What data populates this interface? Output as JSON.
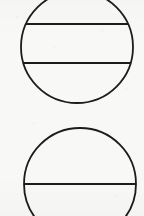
{
  "document": {
    "kind": "scanned-line-drawing",
    "title": "Two circles with horizontal chords",
    "background_color": "#f8f8f7",
    "ink_color": "#1d1c1b",
    "stroke_width": 1.8,
    "width": 144,
    "height": 216
  },
  "figures": [
    {
      "id": "top-circle",
      "label": "Upper circle with two chords",
      "shape": "circle",
      "center_x": 77,
      "center_y": 47,
      "radius": 56,
      "clipped_edge": "top",
      "chords": [
        {
          "id": "top-circle-chord-upper",
          "label": "Upper chord",
          "y": 24
        },
        {
          "id": "top-circle-chord-lower",
          "label": "Lower chord",
          "y": 63
        }
      ]
    },
    {
      "id": "bottom-circle",
      "label": "Lower circle with one chord",
      "shape": "circle",
      "center_x": 80,
      "center_y": 184,
      "radius": 56,
      "clipped_edge": "bottom",
      "chords": [
        {
          "id": "bottom-circle-chord-diameter",
          "label": "Diameter chord",
          "y": 184
        }
      ]
    }
  ]
}
